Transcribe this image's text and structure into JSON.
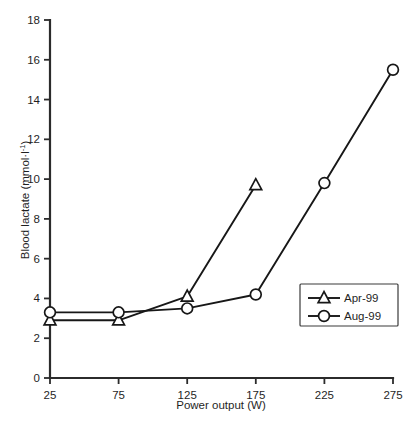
{
  "chart_data": {
    "type": "line",
    "title": "",
    "xlabel": "Power output (W)",
    "ylabel": "Blood lactate (mmol·l⁻¹)",
    "ylabel_parts": {
      "main": "Blood lactate (mmol·l",
      "sup": "-1",
      "tail": ")"
    },
    "x": [
      25,
      75,
      125,
      175,
      225,
      275
    ],
    "xtick_labels": [
      "25",
      "75",
      "125",
      "175",
      "225",
      "275"
    ],
    "ytick_labels": [
      "0",
      "2",
      "4",
      "6",
      "8",
      "10",
      "12",
      "14",
      "16",
      "18"
    ],
    "yticks": [
      0,
      2,
      4,
      6,
      8,
      10,
      12,
      14,
      16,
      18
    ],
    "xlim": [
      25,
      275
    ],
    "ylim": [
      0,
      18
    ],
    "grid": false,
    "legend_position": "center-right",
    "series": [
      {
        "name": "Apr-99",
        "marker": "triangle",
        "x": [
          25,
          75,
          125,
          175
        ],
        "values": [
          2.9,
          2.9,
          4.1,
          9.7
        ]
      },
      {
        "name": "Aug-99",
        "marker": "circle",
        "x": [
          25,
          75,
          125,
          175,
          225,
          275
        ],
        "values": [
          3.3,
          3.3,
          3.5,
          4.2,
          9.8,
          15.5
        ]
      }
    ],
    "colors": {
      "line": "#171717",
      "marker_fill": "#ffffff",
      "axis": "#2b2b2b",
      "text": "#1f1f1f",
      "background": "#ffffff"
    }
  }
}
